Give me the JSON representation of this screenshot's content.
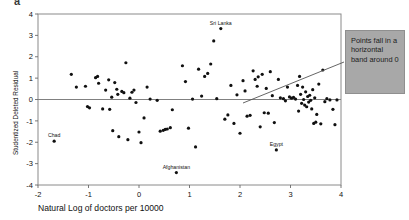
{
  "figure": {
    "panel_letter": "a",
    "callout": {
      "text": "Points fall in a horizontal band around 0",
      "fill_color": "#a8a8a8",
      "border_color": "#8f8f8f",
      "leader_line_color": "#555555"
    }
  },
  "chart_data": {
    "type": "scatter",
    "title": "",
    "xlabel": "Natural Log of doctors per 10000",
    "ylabel": "Studentized Deleted Residual",
    "xlim": [
      -2,
      4
    ],
    "ylim": [
      -4,
      4
    ],
    "xticks": [
      -2,
      -1,
      0,
      1,
      2,
      3,
      4
    ],
    "xticklabels": [
      "-2",
      "-1",
      "0",
      "1",
      "2",
      "3",
      "4"
    ],
    "yticks": [
      -4,
      -3,
      -2,
      -1,
      0,
      1,
      2,
      3,
      4
    ],
    "yticklabels": [
      "-4",
      "-3",
      "-2",
      "-1",
      "0",
      "1",
      "2",
      "3",
      "4"
    ],
    "grid": false,
    "reference_line": {
      "y": 0,
      "color": "#808080"
    },
    "marker": {
      "shape": "circle",
      "color": "#101010",
      "size": 1.6
    },
    "annotations": [
      {
        "label": "Sri Lanka",
        "x": 1.62,
        "y": 3.32
      },
      {
        "label": "Chad",
        "x": -1.68,
        "y": -1.95
      },
      {
        "label": "Afghanistan",
        "x": 0.74,
        "y": -3.42
      },
      {
        "label": "Egypt",
        "x": 2.72,
        "y": -2.36
      }
    ],
    "points": [
      {
        "x": -1.68,
        "y": -1.95
      },
      {
        "x": -1.34,
        "y": 1.18
      },
      {
        "x": -1.24,
        "y": 0.58
      },
      {
        "x": -1.06,
        "y": 0.62
      },
      {
        "x": -1.02,
        "y": -0.33
      },
      {
        "x": -0.98,
        "y": -0.39
      },
      {
        "x": -0.86,
        "y": 1.02
      },
      {
        "x": -0.82,
        "y": 1.08
      },
      {
        "x": -0.8,
        "y": 0.76
      },
      {
        "x": -0.72,
        "y": -0.44
      },
      {
        "x": -0.66,
        "y": 0.44
      },
      {
        "x": -0.6,
        "y": 0.92
      },
      {
        "x": -0.58,
        "y": -0.46
      },
      {
        "x": -0.54,
        "y": 0.11
      },
      {
        "x": -0.52,
        "y": -1.46
      },
      {
        "x": -0.48,
        "y": 0.79
      },
      {
        "x": -0.44,
        "y": 0.48
      },
      {
        "x": -0.42,
        "y": 0.24
      },
      {
        "x": -0.4,
        "y": -1.74
      },
      {
        "x": -0.34,
        "y": 0.38
      },
      {
        "x": -0.3,
        "y": 0.32
      },
      {
        "x": -0.26,
        "y": 1.72
      },
      {
        "x": -0.22,
        "y": -1.88
      },
      {
        "x": -0.18,
        "y": 0.06
      },
      {
        "x": -0.14,
        "y": 0.34
      },
      {
        "x": -0.1,
        "y": 0.44
      },
      {
        "x": -0.06,
        "y": -0.14
      },
      {
        "x": 0.0,
        "y": -1.52
      },
      {
        "x": 0.04,
        "y": -2.02
      },
      {
        "x": 0.1,
        "y": -0.86
      },
      {
        "x": 0.16,
        "y": 0.58
      },
      {
        "x": 0.22,
        "y": 0.02
      },
      {
        "x": 0.36,
        "y": -0.04
      },
      {
        "x": 0.42,
        "y": -1.48
      },
      {
        "x": 0.48,
        "y": -1.44
      },
      {
        "x": 0.52,
        "y": -1.4
      },
      {
        "x": 0.56,
        "y": -1.38
      },
      {
        "x": 0.62,
        "y": -1.32
      },
      {
        "x": 0.66,
        "y": -0.48
      },
      {
        "x": 0.74,
        "y": -3.42
      },
      {
        "x": 0.86,
        "y": 1.58
      },
      {
        "x": 0.92,
        "y": 0.84
      },
      {
        "x": 0.98,
        "y": -1.34
      },
      {
        "x": 1.06,
        "y": 0.02
      },
      {
        "x": 1.12,
        "y": -2.22
      },
      {
        "x": 1.18,
        "y": 1.42
      },
      {
        "x": 1.24,
        "y": 0.16
      },
      {
        "x": 1.3,
        "y": 1.08
      },
      {
        "x": 1.36,
        "y": 1.22
      },
      {
        "x": 1.42,
        "y": 1.66
      },
      {
        "x": 1.48,
        "y": 2.74
      },
      {
        "x": 1.54,
        "y": 0.04
      },
      {
        "x": 1.62,
        "y": 3.32
      },
      {
        "x": 1.7,
        "y": -0.92
      },
      {
        "x": 1.76,
        "y": -0.72
      },
      {
        "x": 1.82,
        "y": 0.66
      },
      {
        "x": 1.88,
        "y": -1.12
      },
      {
        "x": 1.94,
        "y": 0.22
      },
      {
        "x": 2.0,
        "y": -1.58
      },
      {
        "x": 2.06,
        "y": 0.88
      },
      {
        "x": 2.1,
        "y": 0.4
      },
      {
        "x": 2.14,
        "y": -0.78
      },
      {
        "x": 2.2,
        "y": -0.74
      },
      {
        "x": 2.26,
        "y": 1.34
      },
      {
        "x": 2.3,
        "y": 0.94
      },
      {
        "x": 2.34,
        "y": 0.62
      },
      {
        "x": 2.36,
        "y": 1.06
      },
      {
        "x": 2.4,
        "y": -1.28
      },
      {
        "x": 2.44,
        "y": 1.18
      },
      {
        "x": 2.48,
        "y": -0.62
      },
      {
        "x": 2.52,
        "y": 0.52
      },
      {
        "x": 2.56,
        "y": -0.64
      },
      {
        "x": 2.6,
        "y": 1.3
      },
      {
        "x": 2.64,
        "y": 0.18
      },
      {
        "x": 2.68,
        "y": -1.08
      },
      {
        "x": 2.72,
        "y": -2.36
      },
      {
        "x": 2.76,
        "y": 0.94
      },
      {
        "x": 2.8,
        "y": 0.08
      },
      {
        "x": 2.86,
        "y": 0.04
      },
      {
        "x": 2.9,
        "y": -0.06
      },
      {
        "x": 2.94,
        "y": 0.58
      },
      {
        "x": 2.98,
        "y": 0.12
      },
      {
        "x": 3.02,
        "y": 0.06
      },
      {
        "x": 3.06,
        "y": 0.1
      },
      {
        "x": 3.1,
        "y": 0.02
      },
      {
        "x": 3.14,
        "y": 0.66
      },
      {
        "x": 3.16,
        "y": -0.54
      },
      {
        "x": 3.18,
        "y": 1.08
      },
      {
        "x": 3.2,
        "y": 0.24
      },
      {
        "x": 3.22,
        "y": -0.18
      },
      {
        "x": 3.24,
        "y": 0.58
      },
      {
        "x": 3.26,
        "y": 0.0
      },
      {
        "x": 3.28,
        "y": -0.26
      },
      {
        "x": 3.3,
        "y": 0.36
      },
      {
        "x": 3.32,
        "y": -0.34
      },
      {
        "x": 3.34,
        "y": 0.14
      },
      {
        "x": 3.36,
        "y": -0.12
      },
      {
        "x": 3.38,
        "y": 0.2
      },
      {
        "x": 3.4,
        "y": -0.04
      },
      {
        "x": 3.42,
        "y": -0.44
      },
      {
        "x": 3.44,
        "y": 0.46
      },
      {
        "x": 3.46,
        "y": -1.12
      },
      {
        "x": 3.48,
        "y": 0.08
      },
      {
        "x": 3.5,
        "y": -1.06
      },
      {
        "x": 3.52,
        "y": -0.7
      },
      {
        "x": 3.56,
        "y": 0.72
      },
      {
        "x": 3.6,
        "y": -1.14
      },
      {
        "x": 3.64,
        "y": 1.38
      },
      {
        "x": 3.68,
        "y": -0.1
      },
      {
        "x": 3.72,
        "y": 0.04
      },
      {
        "x": 3.78,
        "y": -0.02
      },
      {
        "x": 3.84,
        "y": -0.46
      },
      {
        "x": 3.88,
        "y": -1.18
      },
      {
        "x": 3.92,
        "y": -0.02
      }
    ]
  }
}
